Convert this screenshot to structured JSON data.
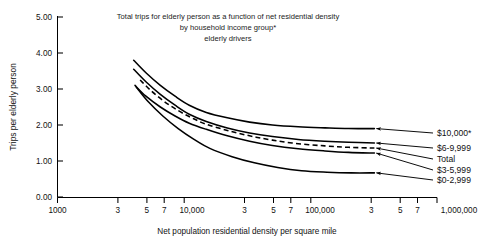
{
  "chart_data": {
    "type": "line",
    "title": "Total trips for elderly person as a function of net residential density by household income group* elderly drivers",
    "title_lines": [
      "Total trips for elderly person as a function of net residential density",
      "by household income group*",
      "elderly drivers"
    ],
    "xlabel": "Net population residential density per square mile",
    "ylabel": "Trips per elderly person",
    "xscale": "log",
    "xlim": [
      1000,
      1000000
    ],
    "ylim": [
      0.0,
      5.0
    ],
    "grid": false,
    "legend_position": "right-inline-labels",
    "ytick_labels": [
      "0.00",
      "1.00",
      "2.00",
      "3.00",
      "4.00",
      "5.00"
    ],
    "ytick_values": [
      0.0,
      1.0,
      2.0,
      3.0,
      4.0,
      5.0
    ],
    "xtick_labels": [
      "1000",
      "3",
      "5",
      "7",
      "10,000",
      "3",
      "5",
      "7",
      "100,000",
      "3",
      "5",
      "7",
      "1,000,000"
    ],
    "xtick_values": [
      1000,
      3000,
      5000,
      7000,
      10000,
      30000,
      50000,
      70000,
      100000,
      300000,
      500000,
      700000,
      1000000
    ],
    "annotations": [
      "* dollar figures are household income groups"
    ],
    "series": [
      {
        "name": "$10,000*",
        "label": "$10,000*",
        "style": "solid",
        "x": [
          4000,
          5000,
          6500,
          8500,
          11000,
          15000,
          22000,
          33000,
          50000,
          80000,
          130000,
          200000,
          320000
        ],
        "values": [
          3.8,
          3.45,
          3.1,
          2.8,
          2.55,
          2.35,
          2.2,
          2.08,
          2.0,
          1.95,
          1.92,
          1.9,
          1.9
        ]
      },
      {
        "name": "$6-9,999",
        "label": "$6-9,999",
        "style": "solid",
        "x": [
          4000,
          5000,
          6500,
          8500,
          11000,
          15000,
          22000,
          33000,
          50000,
          80000,
          130000,
          200000,
          320000
        ],
        "values": [
          3.55,
          3.2,
          2.85,
          2.55,
          2.3,
          2.1,
          1.92,
          1.78,
          1.68,
          1.6,
          1.55,
          1.52,
          1.5
        ]
      },
      {
        "name": "Total",
        "label": "Total",
        "style": "dashed",
        "x": [
          4500,
          5500,
          7000,
          9000,
          11500,
          15000,
          22000,
          33000,
          50000,
          80000,
          130000,
          200000,
          320000
        ],
        "values": [
          3.25,
          2.95,
          2.65,
          2.4,
          2.2,
          2.02,
          1.85,
          1.7,
          1.58,
          1.48,
          1.42,
          1.38,
          1.36
        ]
      },
      {
        "name": "$3-5,999",
        "label": "$3-5,999",
        "style": "solid",
        "x": [
          4100,
          5000,
          6500,
          8500,
          11000,
          15000,
          22000,
          33000,
          50000,
          80000,
          130000,
          200000,
          320000
        ],
        "values": [
          3.1,
          2.8,
          2.5,
          2.25,
          2.05,
          1.88,
          1.7,
          1.55,
          1.43,
          1.34,
          1.28,
          1.24,
          1.22
        ]
      },
      {
        "name": "$0-2,999",
        "label": "$0-2,999",
        "style": "solid",
        "x": [
          4200,
          5200,
          6800,
          9000,
          12000,
          16000,
          24000,
          36000,
          55000,
          85000,
          135000,
          210000,
          320000
        ],
        "values": [
          3.05,
          2.65,
          2.25,
          1.9,
          1.6,
          1.35,
          1.12,
          0.95,
          0.82,
          0.73,
          0.69,
          0.67,
          0.67
        ]
      }
    ]
  },
  "axes": {
    "y_label": "Trips per elderly person",
    "x_label": "Net population residential density per square mile",
    "y_ticks": [
      {
        "label": "5.00",
        "value": 5.0
      },
      {
        "label": "4.00",
        "value": 4.0
      },
      {
        "label": "3.00",
        "value": 3.0
      },
      {
        "label": "2.00",
        "value": 2.0
      },
      {
        "label": "1.00",
        "value": 1.0
      },
      {
        "label": "0.00",
        "value": 0.0
      }
    ],
    "x_ticks": [
      {
        "label": "1000",
        "value": 1000
      },
      {
        "label": "3",
        "value": 3000
      },
      {
        "label": "5",
        "value": 5000
      },
      {
        "label": "7",
        "value": 7000
      },
      {
        "label": "10,000",
        "value": 10000
      },
      {
        "label": "3",
        "value": 30000
      },
      {
        "label": "5",
        "value": 50000
      },
      {
        "label": "7",
        "value": 70000
      },
      {
        "label": "100,000",
        "value": 100000
      },
      {
        "label": "3",
        "value": 300000
      },
      {
        "label": "5",
        "value": 500000
      },
      {
        "label": "7",
        "value": 700000
      },
      {
        "label": "1,000,000",
        "value": 1000000
      }
    ]
  },
  "title": {
    "line1": "Total trips for elderly person as a function of net residential density",
    "line2": "by household income group*",
    "line3": "elderly drivers"
  },
  "series_labels": {
    "s0": "$10,000*",
    "s1": "$6-9,999",
    "s2": "Total",
    "s3": "$3-5,999",
    "s4": "$0-2,999"
  },
  "colors": {
    "line": "#000000",
    "text": "#111111",
    "background": "#ffffff"
  }
}
